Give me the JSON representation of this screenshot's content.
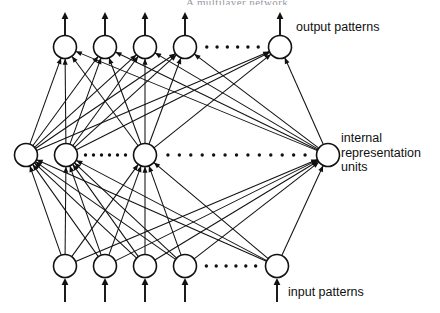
{
  "figure": {
    "title_cropped": "A multilayer network",
    "background_color": "#ffffff",
    "ink_color": "#111111"
  },
  "labels": {
    "output": "output patterns",
    "internal_line1": "internal",
    "internal_line2": "representation",
    "internal_line3": "units",
    "input": "input patterns"
  },
  "chart_data": {
    "type": "diagram",
    "diagram_kind": "feedforward-neural-network",
    "layers": [
      {
        "name": "output",
        "label": "output patterns",
        "y": 47,
        "node_radius": 11.5,
        "node_x": [
          65,
          105,
          145,
          185,
          280
        ],
        "ellipsis_between": [
          3,
          4
        ],
        "ellipsis_dots": 6,
        "arrow_direction": "up-out"
      },
      {
        "name": "internal",
        "label": "internal representation units",
        "y": 155,
        "node_radius": 11.5,
        "node_x": [
          26,
          66,
          145,
          328
        ],
        "ellipsis_between": [
          [
            1,
            2
          ],
          [
            2,
            3
          ]
        ],
        "ellipsis_dots_segment1": 6,
        "ellipsis_dots_segment2": 13,
        "arrow_direction": "none"
      },
      {
        "name": "input",
        "label": "input patterns",
        "y": 266,
        "node_radius": 11.5,
        "node_x": [
          65,
          105,
          145,
          185,
          277
        ],
        "ellipsis_between": [
          3,
          4
        ],
        "ellipsis_dots": 6,
        "arrow_direction": "up-in"
      }
    ],
    "connections": [
      {
        "from_layer": "input",
        "to_layer": "internal",
        "pattern": "fully-connected",
        "arrowheads": "at-internal"
      },
      {
        "from_layer": "internal",
        "to_layer": "output",
        "pattern": "fully-connected",
        "arrowheads": "at-output"
      }
    ],
    "external_arrows": {
      "output_up_from_y": 36,
      "output_up_to_y": 12,
      "input_up_from_y": 302,
      "input_up_to_y": 278
    }
  }
}
